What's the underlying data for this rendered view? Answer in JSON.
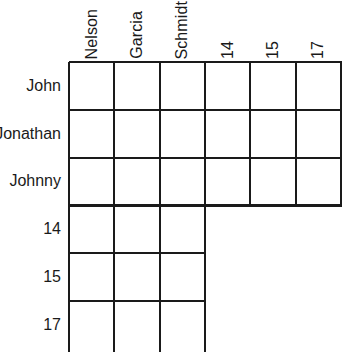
{
  "puzzle": {
    "type": "logic-grid",
    "shape": "L-shaped triangular grid",
    "column_headers": [
      {
        "label": "Nelson",
        "group": "surname",
        "clipped": false
      },
      {
        "label": "Garcia",
        "group": "surname",
        "clipped": false
      },
      {
        "label": "Schmidt",
        "group": "surname",
        "clipped": true
      },
      {
        "label": "14",
        "group": "number",
        "clipped": false
      },
      {
        "label": "15",
        "group": "number",
        "clipped": false
      },
      {
        "label": "17",
        "group": "number",
        "clipped": false
      }
    ],
    "row_labels": [
      {
        "label": "John",
        "group": "firstname"
      },
      {
        "label": "Jonathan",
        "group": "firstname"
      },
      {
        "label": "Johnny",
        "group": "firstname"
      },
      {
        "label": "14",
        "group": "number"
      },
      {
        "label": "15",
        "group": "number"
      },
      {
        "label": "17",
        "group": "number"
      }
    ],
    "blocks": [
      {
        "name": "firstname-vs-all",
        "rows": 3,
        "cols": 6,
        "row_start": 0,
        "col_start": 0
      },
      {
        "name": "number-vs-surname",
        "rows": 3,
        "cols": 3,
        "row_start": 3,
        "col_start": 0
      }
    ],
    "cells": [
      [
        "",
        "",
        "",
        "",
        "",
        ""
      ],
      [
        "",
        "",
        "",
        "",
        "",
        ""
      ],
      [
        "",
        "",
        "",
        "",
        "",
        ""
      ],
      [
        "",
        "",
        ""
      ],
      [
        "",
        "",
        ""
      ],
      [
        "",
        "",
        ""
      ]
    ],
    "colors": {
      "line": "#1a1a1a",
      "background": "#ffffff",
      "text": "#1a1a1a"
    },
    "geometry": {
      "origin_x": 69,
      "origin_y": 62,
      "col_width": 45.33,
      "row_height": 47.8,
      "outer_line_width": 2.4,
      "inner_line_width": 1.8
    }
  }
}
